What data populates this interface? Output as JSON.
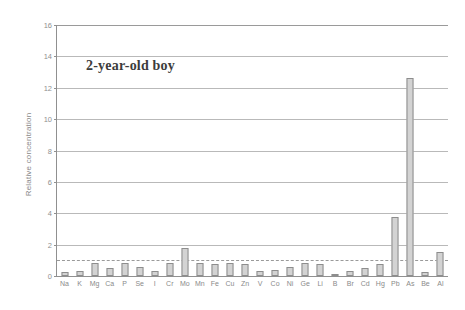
{
  "chart_data": {
    "type": "bar",
    "title": "",
    "annotation": "2-year-old boy",
    "xlabel": "",
    "ylabel": "Relative concentration",
    "ylim": [
      0,
      16
    ],
    "ytick_step": 2,
    "yticks": [
      0,
      2,
      4,
      6,
      8,
      10,
      12,
      14,
      16
    ],
    "grid": true,
    "legend": "none",
    "reference_line": {
      "value": 1.0,
      "style": "dashed",
      "label": ""
    },
    "categories": [
      "Na",
      "K",
      "Mg",
      "Ca",
      "P",
      "Se",
      "I",
      "Cr",
      "Mo",
      "Mn",
      "Fe",
      "Cu",
      "Zn",
      "V",
      "Co",
      "Ni",
      "Ge",
      "Li",
      "B",
      "Br",
      "Cd",
      "Hg",
      "Pb",
      "As",
      "Be",
      "Al"
    ],
    "values": [
      0.25,
      0.3,
      0.8,
      0.5,
      0.8,
      0.55,
      0.3,
      0.85,
      1.8,
      0.8,
      0.75,
      0.8,
      0.75,
      0.3,
      0.4,
      0.55,
      0.8,
      0.75,
      0.1,
      0.35,
      0.5,
      0.75,
      3.75,
      12.6,
      0.25,
      1.55
    ]
  },
  "colors": {
    "bar_fill": "#d3d3d3",
    "bar_edge": "#8d8d8d",
    "gridline": "#b9b9b9",
    "axis": "#909090",
    "tick_text": "#8f8f8f",
    "annotation_text": "#3c3c3c"
  }
}
